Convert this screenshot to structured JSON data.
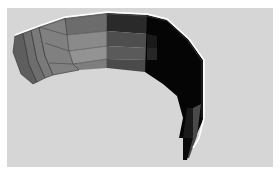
{
  "image": {
    "description": "3D rendered curved faceted ribbon surface in grayscale on light gray background",
    "background_color": "#d6d6d6",
    "frame_color": "#ffffff",
    "shading": {
      "light": "#8a8a8a",
      "mid": "#6a6a6a",
      "dark": "#3a3a3a",
      "black": "#050505",
      "edge_highlight": "#ffffff",
      "mesh_line": "#2a2a2a"
    }
  }
}
